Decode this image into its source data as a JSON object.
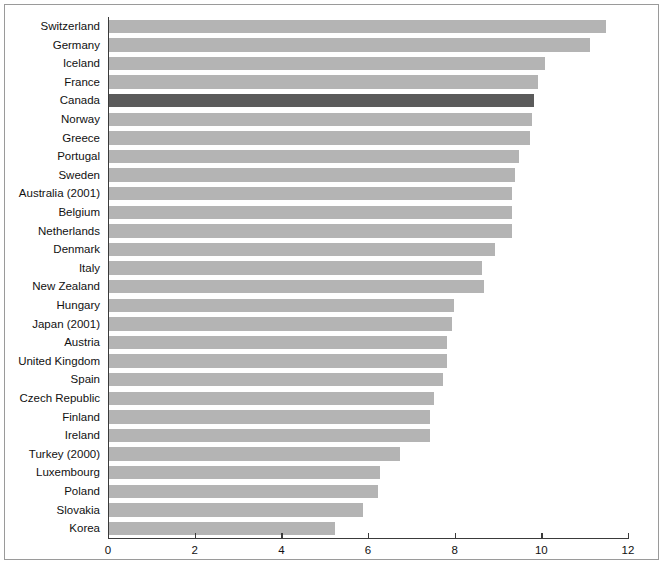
{
  "chart_data": {
    "type": "bar",
    "orientation": "horizontal",
    "title": "",
    "subtitle": "",
    "xlabel": "",
    "ylabel": "",
    "xlim": [
      0,
      12
    ],
    "ylim": null,
    "xticks": [
      0,
      2,
      4,
      6,
      8,
      10,
      12
    ],
    "xtick_labels": [
      "0",
      "2",
      "4",
      "6",
      "8",
      "10",
      "12"
    ],
    "grid": false,
    "legend": null,
    "legend_position": "none",
    "annotations": [],
    "highlight_category": "Canada",
    "colors": {
      "bar": "#b4b4b4",
      "bar_highlight": "#5b5b5b",
      "axis": "#3a3a3a",
      "frame_border": "#9a9a9a",
      "text": "#111111",
      "background": "#ffffff"
    },
    "categories": [
      "Switzerland",
      "Germany",
      "Iceland",
      "France",
      "Canada",
      "Norway",
      "Greece",
      "Portugal",
      "Sweden",
      "Australia (2001)",
      "Belgium",
      "Netherlands",
      "Denmark",
      "Italy",
      "New Zealand",
      "Hungary",
      "Japan (2001)",
      "Austria",
      "United Kingdom",
      "Spain",
      "Czech Republic",
      "Finland",
      "Ireland",
      "Turkey (2000)",
      "Luxembourg",
      "Poland",
      "Slovakia",
      "Korea"
    ],
    "values": [
      11.45,
      11.1,
      10.05,
      9.9,
      9.8,
      9.75,
      9.7,
      9.45,
      9.35,
      9.3,
      9.3,
      9.3,
      8.9,
      8.6,
      8.65,
      7.95,
      7.9,
      7.8,
      7.8,
      7.7,
      7.5,
      7.4,
      7.4,
      6.7,
      6.25,
      6.2,
      5.85,
      5.2
    ]
  }
}
